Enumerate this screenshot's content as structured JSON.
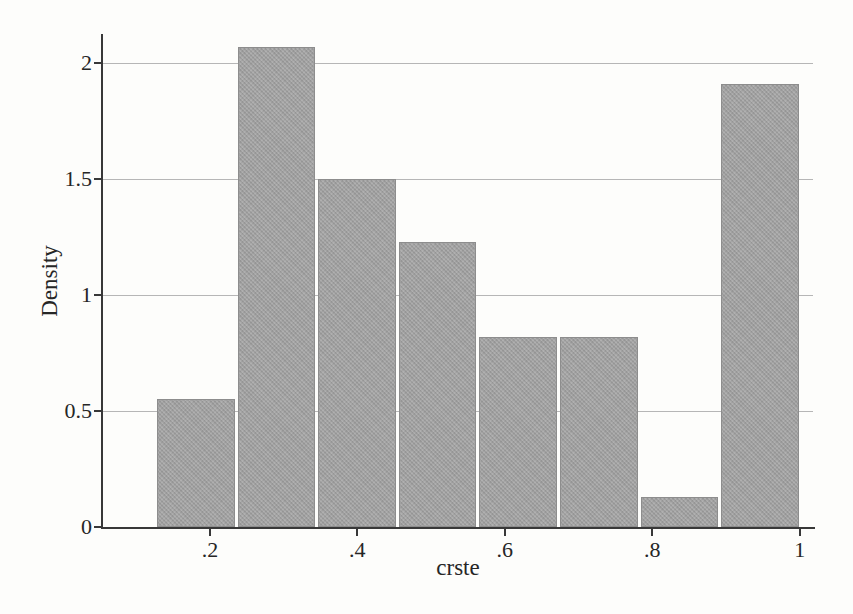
{
  "figure": {
    "background": "#fdfdfb"
  },
  "chart_data": {
    "type": "bar",
    "subtype": "histogram",
    "title": "",
    "xlabel": "crste",
    "ylabel": "Density",
    "bin_start": 0.126,
    "bin_width": 0.1094,
    "densities": [
      0.55,
      2.07,
      1.5,
      1.23,
      0.82,
      0.82,
      0.13,
      1.91
    ],
    "x_ticks": [
      0.2,
      0.4,
      0.6,
      0.8,
      1.0
    ],
    "x_tick_labels": [
      ".2",
      ".4",
      ".6",
      ".8",
      "1"
    ],
    "y_ticks": [
      0,
      0.5,
      1,
      1.5,
      2
    ],
    "y_tick_labels": [
      "0",
      "0.5",
      "1",
      "1.5",
      "2"
    ],
    "xlim": [
      0.055,
      1.018
    ],
    "ylim": [
      0,
      2.125
    ],
    "grid": "horizontal",
    "grid_lines_at": [
      0.5,
      1,
      1.5,
      2
    ],
    "legend": "none",
    "bar_color": "#a3a3a3",
    "bar_border_color": "#8d8d8d",
    "grid_color": "#b6b6b6",
    "axis_color": "#383838",
    "text_color": "#262626"
  }
}
